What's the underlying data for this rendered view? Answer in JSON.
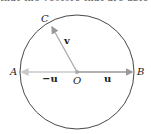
{
  "top_text": "that the vectors that are able to be scr",
  "diagram": {
    "center": {
      "label": "O",
      "x": 77,
      "y": 72
    },
    "radius": 57,
    "points": [
      {
        "label": "A",
        "x": 20,
        "y": 72
      },
      {
        "label": "B",
        "x": 134,
        "y": 72
      },
      {
        "label": "C",
        "x": 51,
        "y": 25
      }
    ],
    "vectors": [
      {
        "label": "u",
        "from": "O",
        "to": "B"
      },
      {
        "label": "−u",
        "from": "O",
        "to": "A"
      },
      {
        "label": "v",
        "from": "O",
        "to": "C"
      }
    ],
    "colors": {
      "circle": "#333333",
      "vector_dark": "#999999",
      "vector_light": "#c8c8c8"
    }
  }
}
